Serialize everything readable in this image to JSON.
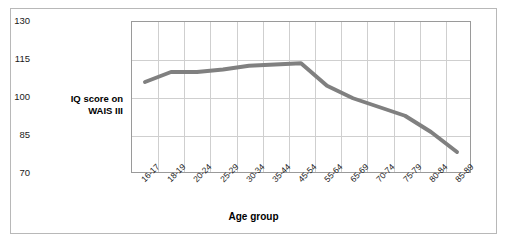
{
  "chart_data": {
    "type": "line",
    "title": "",
    "xlabel": "Age group",
    "ylabel": "IQ score on WAIS III",
    "categories": [
      "16-17",
      "18-19",
      "20-24",
      "25-29",
      "30-34",
      "35-44",
      "45-54",
      "55-64",
      "65-69",
      "70-74",
      "75-79",
      "80-84",
      "85-89"
    ],
    "values": [
      106,
      110,
      110,
      111,
      112.5,
      113,
      113.5,
      104.5,
      99.5,
      96,
      92.5,
      86,
      78
    ],
    "series": [
      {
        "name": "IQ score on WAIS III",
        "values": [
          106,
          110,
          110,
          111,
          112.5,
          113,
          113.5,
          104.5,
          99.5,
          96,
          92.5,
          86,
          78
        ]
      }
    ],
    "ylim": [
      70,
      130
    ],
    "yticks": [
      70,
      85,
      100,
      115,
      130
    ],
    "grid": true,
    "legend": "none",
    "line_color": "#808080",
    "line_width": 4
  },
  "axes": {
    "y_label_line1": "IQ score on",
    "y_label_line2": "WAIS III",
    "x_label": "Age group"
  },
  "colors": {
    "line": "#808080",
    "grid": "#cfcfcf",
    "axis": "#9a9a9a",
    "frame": "#b8b8b8",
    "text": "#1a1a1a",
    "background": "#ffffff"
  }
}
